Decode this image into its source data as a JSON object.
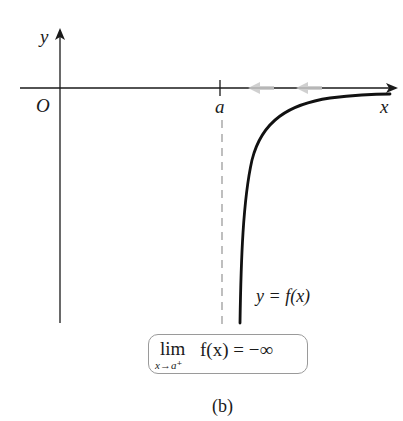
{
  "diagram": {
    "type": "function-graph",
    "axes": {
      "x_label": "x",
      "y_label": "y",
      "origin_label": "O",
      "tick_label": "a"
    },
    "curve_label": "y = f(x)",
    "limit": {
      "operator": "lim",
      "subscript": "x→a⁺",
      "expression": "f(x) = −∞"
    },
    "caption": "(b)",
    "colors": {
      "axis": "#1a1a1a",
      "curve": "#111111",
      "asymptote": "#8a8a8a",
      "arrows": "#c8c8c8",
      "box_border": "#9a9a9a"
    }
  }
}
